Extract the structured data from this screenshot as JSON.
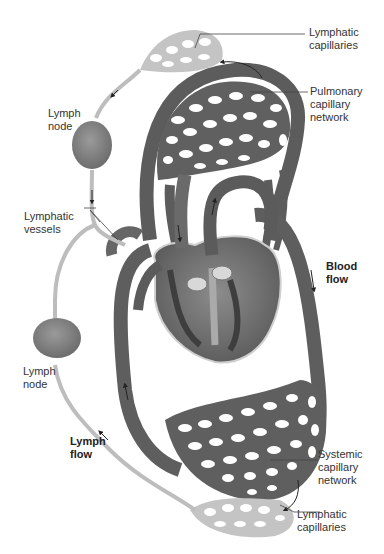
{
  "diagram": {
    "labels": {
      "lymphatic_capillaries_top": "Lymphatic\ncapillaries",
      "pulmonary_capillary_network": "Pulmonary\ncapillary\nnetwork",
      "lymph_node_top": "Lymph\nnode",
      "lymphatic_vessels": "Lymphatic\nvessels",
      "blood_flow": "Blood\nflow",
      "lymph_node_bottom": "Lymph\nnode",
      "lymph_flow": "Lymph\nflow",
      "systemic_capillary_network": "Systemic\ncapillary\nnetwork",
      "lymphatic_capillaries_bottom": "Lymphatic\ncapillaries"
    },
    "colors": {
      "blood_vessel": "#6e6e6e",
      "blood_vessel_dark": "#3f3f3f",
      "lymph_vessel": "#b9b9b9",
      "lymph_node": "#8a8a8a",
      "heart": "#7a7a7a",
      "leader_line": "#444444",
      "background": "#ffffff"
    }
  }
}
